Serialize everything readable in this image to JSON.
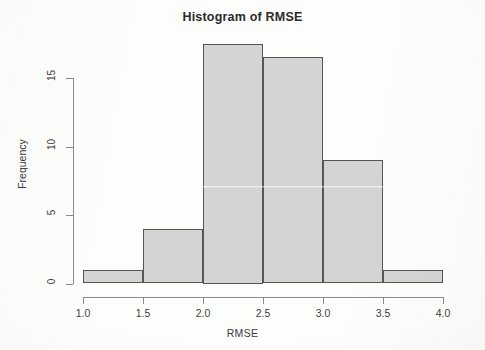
{
  "chart_data": {
    "type": "bar",
    "title": "Histogram of RMSE",
    "xlabel": "RMSE",
    "ylabel": "Frequency",
    "xlim": [
      1.0,
      4.0
    ],
    "ylim": [
      0,
      17.5
    ],
    "grid": false,
    "legend": null,
    "bin_width": 0.5,
    "bin_edges": [
      1.0,
      1.5,
      2.0,
      2.5,
      3.0,
      3.5,
      4.0
    ],
    "categories": [
      "1.0-1.5",
      "1.5-2.0",
      "2.0-2.5",
      "2.5-3.0",
      "3.0-3.5",
      "3.5-4.0"
    ],
    "values": [
      1,
      4,
      17.5,
      16.5,
      9,
      1
    ],
    "bars": [
      {
        "label": "1.0-1.5",
        "x0": 1.0,
        "x1": 1.5,
        "value": 1
      },
      {
        "label": "1.5-2.0",
        "x0": 1.5,
        "x1": 2.0,
        "value": 4
      },
      {
        "label": "2.0-2.5",
        "x0": 2.0,
        "x1": 2.5,
        "value": 17.5
      },
      {
        "label": "2.5-3.0",
        "x0": 2.5,
        "x1": 3.0,
        "value": 16.5
      },
      {
        "label": "3.0-3.5",
        "x0": 3.0,
        "x1": 3.5,
        "value": 9
      },
      {
        "label": "3.5-4.0",
        "x0": 3.5,
        "x1": 4.0,
        "value": 1
      }
    ],
    "x_ticks": [
      "1.0",
      "1.5",
      "2.0",
      "2.5",
      "3.0",
      "3.5",
      "4.0"
    ],
    "x_tick_values": [
      1.0,
      1.5,
      2.0,
      2.5,
      3.0,
      3.5,
      4.0
    ],
    "y_ticks": [
      "0",
      "5",
      "10",
      "15"
    ],
    "y_tick_values": [
      0,
      5,
      10,
      15
    ],
    "colors": {
      "bar_fill": "#d4d4d4",
      "bar_border": "#555555",
      "axis": "#8a8a8a",
      "text": "#3a3a3a",
      "title": "#2b2b2b",
      "background": "#fdfdfc"
    }
  }
}
